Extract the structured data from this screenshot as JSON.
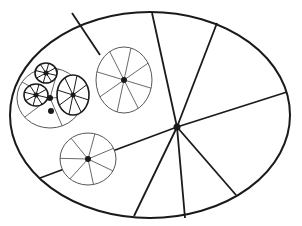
{
  "diagram": {
    "stroke_color": "#1a1a1a",
    "thin_stroke_color": "#444444",
    "background": "#ffffff",
    "outer_ellipse": {
      "cx": 150,
      "cy": 115,
      "rx": 140,
      "ry": 103
    },
    "main_hub": {
      "cx": 177,
      "cy": 127,
      "r": 3.5
    },
    "main_spokes": [
      [
        152,
        13
      ],
      [
        217,
        23
      ],
      [
        287,
        92
      ],
      [
        236,
        195
      ],
      [
        185,
        218
      ],
      [
        134,
        216
      ],
      [
        40,
        178
      ]
    ],
    "main_spoke_through": [
      [
        72,
        13
      ],
      [
        100,
        55
      ]
    ],
    "wheels": [
      {
        "name": "large-upper-wheel",
        "cx": 124,
        "cy": 80,
        "rx": 28,
        "ry": 33,
        "hub_r": 3,
        "spokes": 8,
        "weight": "thin"
      },
      {
        "name": "lower-wheel",
        "cx": 88,
        "cy": 159,
        "rx": 28,
        "ry": 26,
        "hub_r": 3,
        "spokes": 7,
        "weight": "thin"
      },
      {
        "name": "cluster-wheel",
        "cx": 50,
        "cy": 98,
        "rx": 33,
        "ry": 30,
        "hub_r": 3,
        "spokes": 5,
        "weight": "thin"
      },
      {
        "name": "small-wheel-top",
        "cx": 46,
        "cy": 73,
        "rx": 11,
        "ry": 10,
        "hub_r": 2.5,
        "spokes": 8,
        "weight": "bold"
      },
      {
        "name": "small-wheel-left",
        "cx": 36,
        "cy": 95,
        "rx": 12,
        "ry": 11,
        "hub_r": 2.5,
        "spokes": 8,
        "weight": "bold"
      },
      {
        "name": "medium-wheel-right",
        "cx": 73,
        "cy": 95,
        "rx": 16,
        "ry": 20,
        "hub_r": 2.5,
        "spokes": 8,
        "weight": "bold"
      }
    ]
  }
}
